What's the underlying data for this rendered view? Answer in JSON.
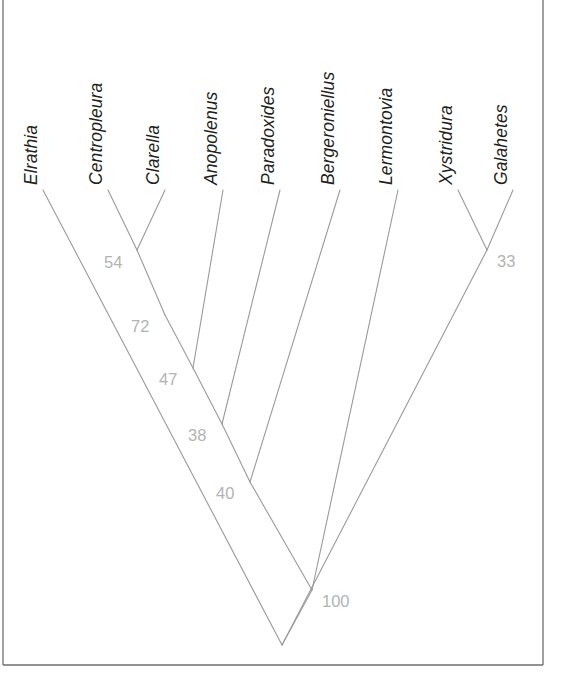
{
  "figure": {
    "type": "phylogenetic-cladogram",
    "background_color": "#ffffff",
    "branch_color": "#9a9a9a",
    "label_color": "#231f20",
    "support_color": "#b3b3b3",
    "frame_color": "#6e6e6e",
    "width": 561,
    "height": 680
  },
  "frame": {
    "left_x": 3,
    "right_x": 543,
    "bottom_y": 665,
    "top_y": 0
  },
  "taxa": [
    {
      "name": "Elrathia",
      "tip_x": 43,
      "tip_y": 190,
      "label_x": 37,
      "label_y": 185
    },
    {
      "name": "Centropleura",
      "tip_x": 108,
      "tip_y": 190,
      "label_x": 102,
      "label_y": 185
    },
    {
      "name": "Clarella",
      "tip_x": 165,
      "tip_y": 190,
      "label_x": 159,
      "label_y": 185
    },
    {
      "name": "Anopolenus",
      "tip_x": 223,
      "tip_y": 190,
      "label_x": 217,
      "label_y": 185
    },
    {
      "name": "Paradoxides",
      "tip_x": 280,
      "tip_y": 190,
      "label_x": 274,
      "label_y": 185
    },
    {
      "name": "Bergeroniellus",
      "tip_x": 340,
      "tip_y": 190,
      "label_x": 334,
      "label_y": 185
    },
    {
      "name": "Lermontovia",
      "tip_x": 398,
      "tip_y": 190,
      "label_x": 392,
      "label_y": 185
    },
    {
      "name": "Xystridura",
      "tip_x": 458,
      "tip_y": 190,
      "label_x": 452,
      "label_y": 185
    },
    {
      "name": "Galahetes",
      "tip_x": 513,
      "tip_y": 190,
      "label_x": 507,
      "label_y": 185
    }
  ],
  "nodes": [
    {
      "support": "54",
      "x": 137,
      "y": 250,
      "label_x": 104,
      "label_y": 268
    },
    {
      "support": "72",
      "x": 165,
      "y": 315,
      "label_x": 131,
      "label_y": 332
    },
    {
      "support": "47",
      "x": 193,
      "y": 368,
      "label_x": 159,
      "label_y": 385
    },
    {
      "support": "38",
      "x": 222,
      "y": 424,
      "label_x": 188,
      "label_y": 441
    },
    {
      "support": "40",
      "x": 250,
      "y": 482,
      "label_x": 216,
      "label_y": 499
    },
    {
      "support": "100",
      "x": 312,
      "y": 590,
      "label_x": 322,
      "label_y": 607
    },
    {
      "support": "33",
      "x": 487,
      "y": 250,
      "label_x": 497,
      "label_y": 267
    }
  ],
  "root": {
    "x": 282,
    "y": 645
  },
  "chart_data": {
    "type": "tree",
    "title": "",
    "taxon_labels": [
      "Elrathia",
      "Centropleura",
      "Clarella",
      "Anopolenus",
      "Paradoxides",
      "Bergeroniellus",
      "Lermontovia",
      "Xystridura",
      "Galahetes"
    ],
    "support_values": [
      "54",
      "72",
      "47",
      "38",
      "40",
      "100",
      "33"
    ],
    "topology": "(((((((Centropleura,Clarella)54,Elrathia)72,Anopolenus)47,Paradoxides)38,Bergeroniellus)40,Lermontovia),(Xystridura,Galahetes)33)100",
    "newick": "((((((Centropleura,Clarella)54,Elrathia)72,Anopolenus)47,Paradoxides)38,Bergeroniellus)40,Lermontovia)?,(Xystridura,Galahetes)33)100;",
    "clades": [
      {
        "support": "54",
        "members": [
          "Centropleura",
          "Clarella"
        ]
      },
      {
        "support": "72",
        "members": [
          "Elrathia",
          "Centropleura",
          "Clarella"
        ]
      },
      {
        "support": "47",
        "members": [
          "Elrathia",
          "Centropleura",
          "Clarella",
          "Anopolenus"
        ]
      },
      {
        "support": "38",
        "members": [
          "Elrathia",
          "Centropleura",
          "Clarella",
          "Anopolenus",
          "Paradoxides"
        ]
      },
      {
        "support": "40",
        "members": [
          "Elrathia",
          "Centropleura",
          "Clarella",
          "Anopolenus",
          "Paradoxides",
          "Bergeroniellus"
        ]
      },
      {
        "support": "100",
        "members": [
          "Elrathia",
          "Centropleura",
          "Clarella",
          "Anopolenus",
          "Paradoxides",
          "Bergeroniellus",
          "Lermontovia"
        ]
      },
      {
        "support": "33",
        "members": [
          "Xystridura",
          "Galahetes"
        ]
      }
    ],
    "xlabel": "",
    "ylabel": "",
    "grid": false,
    "legend": false
  }
}
